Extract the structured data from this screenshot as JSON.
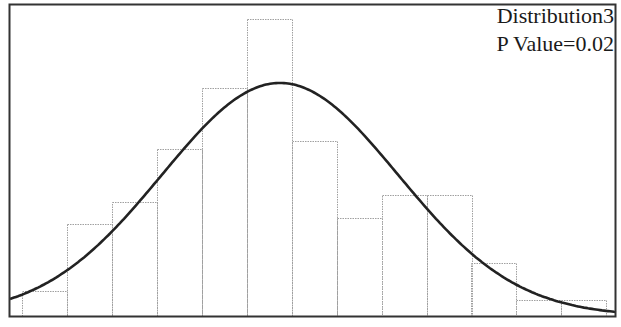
{
  "chart_data": {
    "type": "bar",
    "subtype": "histogram_with_normal_fit",
    "title": "",
    "xlabel": "",
    "ylabel": "",
    "legend": {
      "name": "Distribution3",
      "annotation": "P Value=0.02",
      "position": "top-right"
    },
    "grid": false,
    "bins": 13,
    "values": [
      1,
      4,
      5,
      7,
      9,
      12,
      7,
      4,
      5,
      5,
      2,
      1,
      1
    ],
    "bar_pixels": {
      "lefts": [
        22,
        67,
        112,
        157,
        202,
        247,
        292,
        337,
        382,
        427,
        471,
        516,
        561
      ],
      "width": 45,
      "tops": [
        291,
        224,
        202,
        149,
        88,
        19,
        141,
        218,
        195,
        195,
        263,
        300,
        300
      ]
    },
    "fit_curve": {
      "type": "normal",
      "peak_x_px": 280,
      "peak_y_px": 83,
      "color": "#222222"
    },
    "bar_edge_color": "#a0a0a0"
  },
  "legend": {
    "series_name": "Distribution3",
    "p_value_text": "P Value=0.02"
  }
}
